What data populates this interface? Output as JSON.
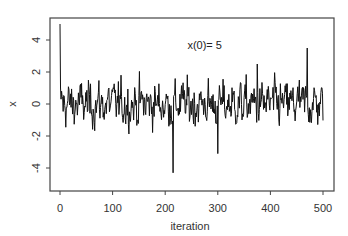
{
  "chart_data": {
    "type": "line",
    "title": "",
    "xlabel": "iteration",
    "ylabel": "x",
    "xlim": [
      -10,
      520
    ],
    "ylim": [
      -5.4,
      5.4
    ],
    "xticks": [
      0,
      100,
      200,
      300,
      400,
      500
    ],
    "xtick_labels": [
      "0",
      "100",
      "200",
      "300",
      "400",
      "500"
    ],
    "yticks": [
      -4,
      -2,
      0,
      2,
      4
    ],
    "ytick_labels": [
      "-4",
      "-2",
      "0",
      "2",
      "4"
    ],
    "grid": false,
    "legend": null,
    "annotations": [
      {
        "text": "x(0)= 5",
        "x": 265,
        "y": 3.7
      }
    ],
    "series": [
      {
        "name": "x",
        "color": "#111111",
        "initial_value": 5,
        "n_points": 501,
        "x_start": 0,
        "x_step": 1,
        "notable_points": [
          {
            "x": 0,
            "y": 5.0
          },
          {
            "x": 215,
            "y": -4.3
          },
          {
            "x": 300,
            "y": -3.1
          },
          {
            "x": 375,
            "y": 2.5
          },
          {
            "x": 470,
            "y": 3.5
          }
        ],
        "typical_range": [
          -2.2,
          2.1
        ]
      }
    ]
  },
  "annotation_text": "x(0)= 5",
  "axes": {
    "xlabel": "iteration",
    "ylabel": "x"
  }
}
